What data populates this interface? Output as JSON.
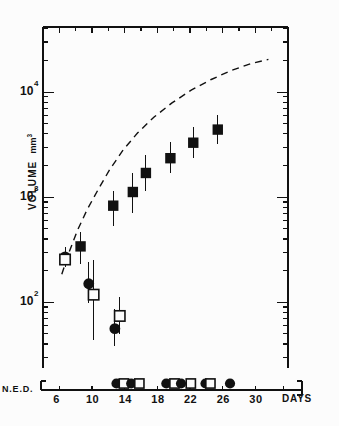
{
  "figure": {
    "background": "#fcfcfc",
    "ink": "#111111",
    "width": 339,
    "height": 426
  },
  "labels": {
    "ylabel": "VOLUME",
    "yunit": "mm",
    "yunit_exp": "3",
    "xlabel": "DAYS",
    "ned_label": "N.E.D."
  },
  "chart_data": {
    "type": "scatter",
    "title": "",
    "xlabel": "DAYS",
    "ylabel": "VOLUME  mm3",
    "xlim": [
      4,
      34
    ],
    "ylim_log10": [
      1.45,
      4.62
    ],
    "yscale": "log",
    "grid": false,
    "legend_position": "none",
    "xticks": [
      6,
      10,
      14,
      18,
      22,
      26,
      30
    ],
    "xtick_labels": [
      "6",
      "10",
      "14",
      "18",
      "22",
      "26",
      "30"
    ],
    "yticks_major": [
      100,
      1000,
      10000
    ],
    "ytick_labels": [
      "10",
      "10",
      "10"
    ],
    "ytick_exponents": [
      "2",
      "3",
      "4"
    ],
    "axis_box": "top-right-ticks-mirrored",
    "series": [
      {
        "name": "filled-square",
        "marker": "filled-square",
        "points": [
          {
            "x": 8.6,
            "y": 340,
            "ylo": 230,
            "yhi": 470
          },
          {
            "x": 12.6,
            "y": 830,
            "ylo": 530,
            "yhi": 1150
          },
          {
            "x": 15.0,
            "y": 1120,
            "ylo": 700,
            "yhi": 1700
          },
          {
            "x": 16.6,
            "y": 1700,
            "ylo": 1150,
            "yhi": 2500
          },
          {
            "x": 19.6,
            "y": 2350,
            "ylo": 1700,
            "yhi": 3350
          },
          {
            "x": 22.4,
            "y": 3300,
            "ylo": 2350,
            "yhi": 4700
          },
          {
            "x": 25.4,
            "y": 4400,
            "ylo": 3200,
            "yhi": 6100
          }
        ]
      },
      {
        "name": "filled-circle",
        "marker": "filled-circle",
        "points": [
          {
            "x": 6.7,
            "y": 270,
            "ylo": 215,
            "yhi": 335
          },
          {
            "x": 9.6,
            "y": 150,
            "ylo": 98,
            "yhi": 240
          },
          {
            "x": 12.8,
            "y": 56,
            "ylo": 38,
            "yhi": 86
          }
        ]
      },
      {
        "name": "open-square",
        "marker": "open-square",
        "points": [
          {
            "x": 6.7,
            "y": 255,
            "ylo": 215,
            "yhi": 320
          },
          {
            "x": 10.2,
            "y": 118,
            "ylo": 44,
            "yhi": 255
          },
          {
            "x": 13.4,
            "y": 74,
            "ylo": 50,
            "yhi": 112
          }
        ]
      }
    ],
    "reference_curve": {
      "name": "control-growth-curve",
      "style": "dashed",
      "x": [
        6.3,
        7.2,
        8.2,
        9.4,
        10.8,
        12.2,
        13.8,
        15.6,
        17.6,
        19.8,
        22.2,
        24.6,
        27.0,
        29.4,
        31.6
      ],
      "y": [
        185,
        300,
        480,
        760,
        1200,
        1850,
        2800,
        4100,
        5800,
        7900,
        10500,
        13200,
        16000,
        18600,
        20500
      ]
    },
    "ned_row": {
      "label": "N.E.D.",
      "description": "treatment event markers plotted on a separate axis below the plot",
      "markers": [
        {
          "x": 13.0,
          "type": "filled-circle"
        },
        {
          "x": 13.9,
          "type": "open-square"
        },
        {
          "x": 14.8,
          "type": "filled-circle"
        },
        {
          "x": 15.8,
          "type": "open-square"
        },
        {
          "x": 19.1,
          "type": "filled-circle"
        },
        {
          "x": 20.1,
          "type": "open-square"
        },
        {
          "x": 20.9,
          "type": "filled-circle"
        },
        {
          "x": 22.1,
          "type": "open-square"
        },
        {
          "x": 23.9,
          "type": "filled-circle"
        },
        {
          "x": 24.5,
          "type": "open-square"
        },
        {
          "x": 26.9,
          "type": "filled-circle"
        }
      ]
    }
  }
}
